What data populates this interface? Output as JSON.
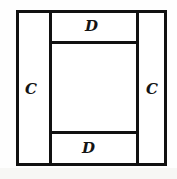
{
  "figure": {
    "type": "geometric-diagram",
    "background_color": "#ffffff",
    "stroke_color": "#111111",
    "stroke_width_px": 3,
    "outer_rect": {
      "x": 16,
      "y": 10,
      "width": 151,
      "height": 156
    },
    "dividers": {
      "vertical_left_x": 49,
      "vertical_right_x": 136,
      "horizontal_top_y": 41,
      "horizontal_bottom_y": 131
    },
    "labels": [
      {
        "id": "d-top",
        "text": "D",
        "position": "top-strip"
      },
      {
        "id": "d-bottom",
        "text": "D",
        "position": "bottom-strip"
      },
      {
        "id": "c-left",
        "text": "C",
        "position": "left-strip"
      },
      {
        "id": "c-right",
        "text": "C",
        "position": "right-strip"
      }
    ]
  }
}
